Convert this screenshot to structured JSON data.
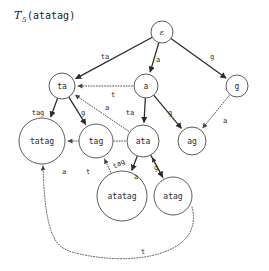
{
  "figure": {
    "title_prefix": "T",
    "title_subscript": "5",
    "title_argument": "(atatag)",
    "background_color": "#ffffff",
    "node_stroke_color": "#4a4a4a",
    "solid_edge_color": "#2b2b2b",
    "dotted_edge_color": "#555555"
  },
  "nodes": [
    {
      "id": "root",
      "label": "ε",
      "cx": 162,
      "cy": 32,
      "r": 11
    },
    {
      "id": "ta",
      "label": "ta",
      "cx": 62,
      "cy": 86,
      "r": 13
    },
    {
      "id": "a",
      "label": "a",
      "cx": 146,
      "cy": 86,
      "r": 12
    },
    {
      "id": "g",
      "label": "g",
      "cx": 237,
      "cy": 86,
      "r": 11
    },
    {
      "id": "tatag",
      "label": "tatag",
      "cx": 42,
      "cy": 141,
      "r": 23
    },
    {
      "id": "tag",
      "label": "tag",
      "cx": 96,
      "cy": 141,
      "r": 17
    },
    {
      "id": "ata",
      "label": "ata",
      "cx": 143,
      "cy": 141,
      "r": 16
    },
    {
      "id": "ag",
      "label": "ag",
      "cx": 192,
      "cy": 141,
      "r": 14
    },
    {
      "id": "atatag",
      "label": "atatag",
      "cx": 122,
      "cy": 196,
      "r": 25
    },
    {
      "id": "atag",
      "label": "atag",
      "cx": 173,
      "cy": 196,
      "r": 19
    }
  ],
  "solid_edges": [
    {
      "from": "root",
      "to": "ta",
      "label": "ta",
      "label_x": 105,
      "label_y": 57
    },
    {
      "from": "root",
      "to": "a",
      "label": "a",
      "label_x": 158,
      "label_y": 60
    },
    {
      "from": "root",
      "to": "g",
      "label": "g",
      "label_x": 212,
      "label_y": 57
    },
    {
      "from": "ta",
      "to": "tatag",
      "label": "tag",
      "label_x": 38,
      "label_y": 113
    },
    {
      "from": "ta",
      "to": "tag",
      "label": "g",
      "label_x": 83,
      "label_y": 113
    },
    {
      "from": "a",
      "to": "ata",
      "label": "ta",
      "label_x": 130,
      "label_y": 113
    },
    {
      "from": "a",
      "to": "ag",
      "label": "g",
      "label_x": 170,
      "label_y": 113
    },
    {
      "from": "ata",
      "to": "atatag",
      "label": "tag",
      "label_x": 119,
      "label_y": 164,
      "rotated": true
    },
    {
      "from": "ata",
      "to": "atag",
      "label": "g",
      "label_x": 156,
      "label_y": 168
    }
  ],
  "dotted_edges": [
    {
      "from": "a",
      "to": "ta",
      "label": "t",
      "label_x": 113,
      "label_y": 95
    },
    {
      "from": "ata",
      "to": "ta",
      "label": "a",
      "label_x": 107,
      "label_y": 108
    },
    {
      "from": "g",
      "to": "ag",
      "label": "a",
      "label_x": 225,
      "label_y": 121
    },
    {
      "from": "ata",
      "to": "tatag",
      "label": "a",
      "label_x": 64,
      "label_y": 172
    },
    {
      "from": "atatag",
      "to": "tag",
      "label": "t",
      "label_x": 88,
      "label_y": 172
    },
    {
      "from": "atag",
      "to": "ata",
      "label": "a",
      "label_x": 136,
      "label_y": 177
    },
    {
      "from": "atag",
      "to": "tatag",
      "label": "t",
      "label_x": 143,
      "label_y": 252
    }
  ]
}
